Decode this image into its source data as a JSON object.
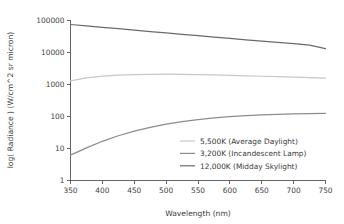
{
  "chart_data": {
    "type": "line",
    "title": "",
    "xlabel": "Wavelength (nm)",
    "ylabel": "log( Radiance ) (W/cm^2 sr micron)",
    "xlim": [
      350,
      750
    ],
    "ylim": [
      1,
      100000
    ],
    "yscale": "log",
    "grid": false,
    "legend_position": "inside-lower-right",
    "xticks": [
      350,
      400,
      450,
      500,
      550,
      600,
      650,
      700,
      750
    ],
    "xtick_labels": [
      "350",
      "400",
      "450",
      "500",
      "550",
      "600",
      "650",
      "700",
      "750"
    ],
    "yticks": [
      1,
      10,
      100,
      1000,
      10000,
      100000
    ],
    "ytick_labels": [
      "1",
      "10",
      "100",
      "1000",
      "10000",
      "100000"
    ],
    "x": [
      350,
      375,
      400,
      425,
      450,
      475,
      500,
      525,
      550,
      575,
      600,
      625,
      650,
      675,
      700,
      725,
      750
    ],
    "series": [
      {
        "name": "5,500K (Average Daylight)",
        "color": "#c8c8c8",
        "values": [
          1300,
          1600,
          1820,
          1960,
          2050,
          2090,
          2100,
          2080,
          2040,
          1990,
          1930,
          1870,
          1810,
          1750,
          1690,
          1640,
          1590
        ]
      },
      {
        "name": "3,200K (Incandescent Lamp)",
        "color": "#8c8c8c",
        "values": [
          6.2,
          10.5,
          16.8,
          25.0,
          35.0,
          46.0,
          57.5,
          69.0,
          80.0,
          90.0,
          98.5,
          106.0,
          112.5,
          117.5,
          121.5,
          124.0,
          126.0
        ]
      },
      {
        "name": "12,000K (Midday Skylight)",
        "color": "#6a6a6a",
        "values": [
          75000,
          68000,
          61500,
          55500,
          50000,
          45200,
          40800,
          36900,
          33400,
          30300,
          27500,
          25000,
          22700,
          20700,
          18800,
          17100,
          13200
        ]
      }
    ]
  },
  "axis": {
    "xlabel": "Wavelength (nm)",
    "ylabel": "log( Radiance ) (W/cm^2 sr micron)"
  },
  "legend": {
    "entries": [
      {
        "label": "5,500K (Average Daylight)",
        "color": "#c8c8c8"
      },
      {
        "label": "3,200K (Incandescent Lamp)",
        "color": "#8c8c8c"
      },
      {
        "label": "12,000K (Midday Skylight)",
        "color": "#6a6a6a"
      }
    ]
  },
  "colors": {
    "background": "#ffffff",
    "axis": "#555555",
    "text": "#3a3a3a"
  }
}
